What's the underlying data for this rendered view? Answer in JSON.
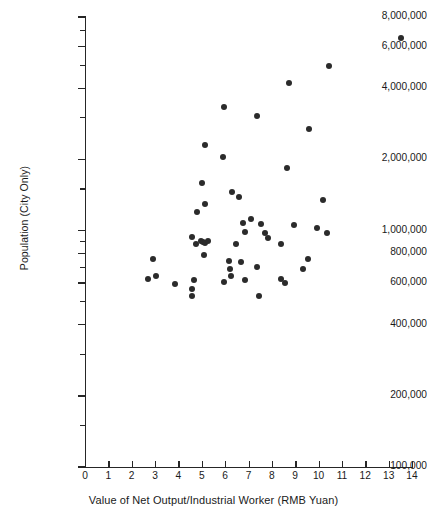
{
  "chart_data": {
    "type": "scatter",
    "title": "",
    "xlabel": "Value of Net Output/Industrial Worker (RMB Yuan)",
    "ylabel": "Population (City Only)",
    "xscale": "linear",
    "yscale": "log",
    "xlim": [
      0,
      14
    ],
    "ylim": [
      100000,
      8000000
    ],
    "grid": false,
    "legend": null,
    "xticks": [
      0,
      1,
      2,
      3,
      4,
      5,
      6,
      7,
      8,
      9,
      10,
      11,
      12,
      13,
      14
    ],
    "xtick_labels": [
      "0",
      "1",
      "2",
      "3",
      "4",
      "5",
      "6",
      "7",
      "8",
      "9",
      "10",
      "11",
      "12",
      "13",
      "14"
    ],
    "yticks": [
      100000,
      200000,
      400000,
      600000,
      800000,
      1000000,
      2000000,
      4000000,
      6000000,
      8000000
    ],
    "ytick_labels": [
      "100,000",
      "200,000",
      "400,000",
      "600,000",
      "800,000",
      "1,000,000",
      "2,000,000",
      "4,000,000",
      "6,000,000",
      "8,000,000"
    ],
    "yminor_ticks": [
      150000,
      300000,
      500000,
      700000,
      900000,
      1500000,
      3000000,
      5000000,
      7000000
    ],
    "marker": "filled-circle",
    "marker_color": "#2b2b2b",
    "marker_size": 6,
    "n_points": 52,
    "points": [
      {
        "x": 13.55,
        "y": 6500000
      },
      {
        "x": 10.45,
        "y": 4950000
      },
      {
        "x": 8.75,
        "y": 4200000
      },
      {
        "x": 5.95,
        "y": 3320000
      },
      {
        "x": 7.35,
        "y": 3050000
      },
      {
        "x": 9.6,
        "y": 2700000
      },
      {
        "x": 5.15,
        "y": 2300000
      },
      {
        "x": 8.65,
        "y": 1830000
      },
      {
        "x": 5.9,
        "y": 2050000
      },
      {
        "x": 5.0,
        "y": 1590000
      },
      {
        "x": 6.3,
        "y": 1460000
      },
      {
        "x": 6.6,
        "y": 1380000
      },
      {
        "x": 5.15,
        "y": 1290000
      },
      {
        "x": 10.2,
        "y": 1340000
      },
      {
        "x": 9.95,
        "y": 1030000
      },
      {
        "x": 10.35,
        "y": 975000
      },
      {
        "x": 4.8,
        "y": 1200000
      },
      {
        "x": 7.1,
        "y": 1120000
      },
      {
        "x": 6.75,
        "y": 1080000
      },
      {
        "x": 7.55,
        "y": 1065000
      },
      {
        "x": 8.95,
        "y": 1060000
      },
      {
        "x": 7.7,
        "y": 975000
      },
      {
        "x": 7.85,
        "y": 930000
      },
      {
        "x": 6.85,
        "y": 985000
      },
      {
        "x": 4.6,
        "y": 935000
      },
      {
        "x": 4.95,
        "y": 905000
      },
      {
        "x": 5.05,
        "y": 895000
      },
      {
        "x": 5.15,
        "y": 890000
      },
      {
        "x": 5.25,
        "y": 905000
      },
      {
        "x": 4.75,
        "y": 880000
      },
      {
        "x": 6.45,
        "y": 880000
      },
      {
        "x": 8.4,
        "y": 880000
      },
      {
        "x": 5.1,
        "y": 785000
      },
      {
        "x": 2.9,
        "y": 760000
      },
      {
        "x": 6.15,
        "y": 740000
      },
      {
        "x": 6.2,
        "y": 690000
      },
      {
        "x": 6.7,
        "y": 735000
      },
      {
        "x": 7.35,
        "y": 700000
      },
      {
        "x": 9.55,
        "y": 755000
      },
      {
        "x": 9.35,
        "y": 690000
      },
      {
        "x": 2.7,
        "y": 625000
      },
      {
        "x": 3.05,
        "y": 640000
      },
      {
        "x": 3.85,
        "y": 595000
      },
      {
        "x": 4.65,
        "y": 615000
      },
      {
        "x": 6.25,
        "y": 640000
      },
      {
        "x": 6.85,
        "y": 620000
      },
      {
        "x": 4.6,
        "y": 565000
      },
      {
        "x": 4.6,
        "y": 530000
      },
      {
        "x": 8.4,
        "y": 625000
      },
      {
        "x": 8.55,
        "y": 600000
      },
      {
        "x": 7.45,
        "y": 530000
      },
      {
        "x": 5.95,
        "y": 605000
      }
    ]
  }
}
